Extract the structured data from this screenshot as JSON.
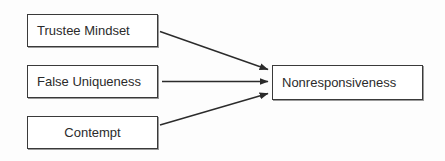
{
  "diagram": {
    "type": "path-diagram",
    "background_color": "#fdfdfd",
    "node_fill": "#ffffff",
    "node_border_color": "#3a3a3a",
    "edge_color": "#2b2b2b",
    "text_color": "#2b2b2b",
    "nodes": [
      {
        "id": "trustee-mindset",
        "label": "Trustee Mindset",
        "role": "predictor"
      },
      {
        "id": "false-uniqueness",
        "label": "False Uniqueness",
        "role": "predictor"
      },
      {
        "id": "contempt",
        "label": "Contempt",
        "role": "predictor"
      },
      {
        "id": "nonresponsiveness",
        "label": "Nonresponsiveness",
        "role": "outcome"
      }
    ],
    "edges": [
      {
        "id": "edge-trustee-to-nonresponsiveness",
        "from": "trustee-mindset",
        "to": "nonresponsiveness",
        "style": "solid-arrow",
        "direction": "descending"
      },
      {
        "id": "edge-uniqueness-to-nonresponsiveness",
        "from": "false-uniqueness",
        "to": "nonresponsiveness",
        "style": "solid-arrow",
        "direction": "horizontal"
      },
      {
        "id": "edge-contempt-to-nonresponsiveness",
        "from": "contempt",
        "to": "nonresponsiveness",
        "style": "solid-arrow",
        "direction": "ascending"
      }
    ]
  }
}
